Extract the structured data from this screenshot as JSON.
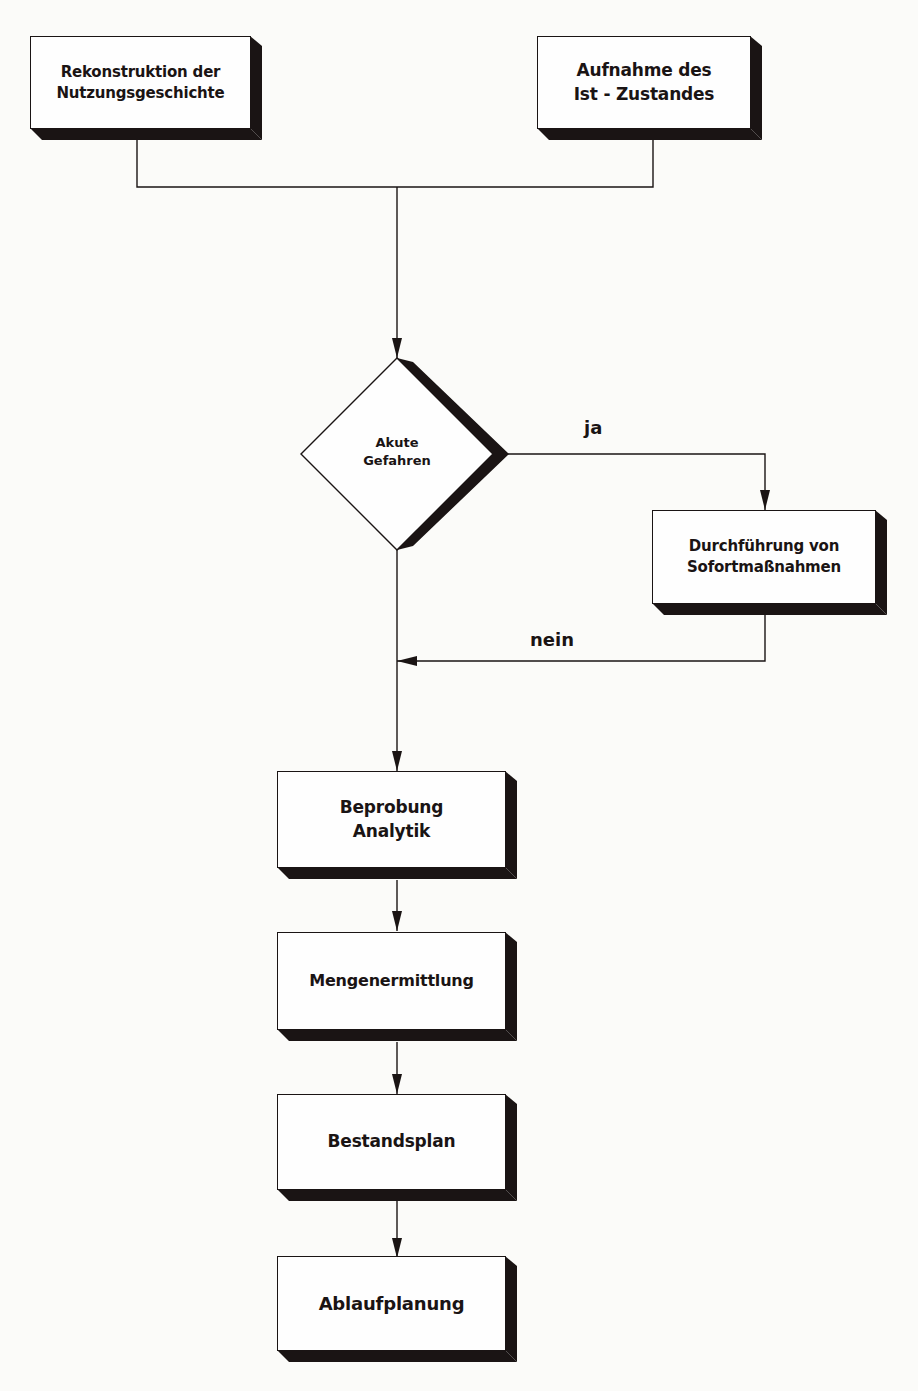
{
  "diagram": {
    "type": "flowchart",
    "nodes": {
      "history": {
        "line1": "Rekonstruktion der",
        "line2": "Nutzungsgeschichte"
      },
      "current_state": {
        "line1": "Aufnahme des",
        "line2": "Ist - Zustandes"
      },
      "decision": {
        "line1": "Akute",
        "line2": "Gefahren"
      },
      "immediate_measures": {
        "line1": "Durchführung von",
        "line2": "Sofortmaßnahmen"
      },
      "sampling": {
        "line1": "Beprobung",
        "line2": "Analytik"
      },
      "quantity": {
        "line1": "Mengenermittlung"
      },
      "inventory_plan": {
        "line1": "Bestandsplan"
      },
      "schedule": {
        "line1": "Ablaufplanung"
      }
    },
    "edge_labels": {
      "yes": "ja",
      "no": "nein"
    },
    "edges": [
      {
        "from": "history",
        "to": "decision"
      },
      {
        "from": "current_state",
        "to": "decision"
      },
      {
        "from": "decision",
        "to": "immediate_measures",
        "label": "ja"
      },
      {
        "from": "immediate_measures",
        "to": "sampling"
      },
      {
        "from": "decision",
        "to": "sampling",
        "label": "nein"
      },
      {
        "from": "sampling",
        "to": "quantity"
      },
      {
        "from": "quantity",
        "to": "inventory_plan"
      },
      {
        "from": "inventory_plan",
        "to": "schedule"
      }
    ]
  }
}
